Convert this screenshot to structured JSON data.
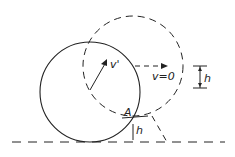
{
  "diagram": {
    "type": "physics-rolling-circle",
    "labels": {
      "velocity": "v'",
      "velocity_zero": "v=0",
      "point": "A",
      "height_right": "h",
      "height_bottom": "h"
    },
    "colors": {
      "stroke": "#222222",
      "background": "#ffffff"
    }
  }
}
